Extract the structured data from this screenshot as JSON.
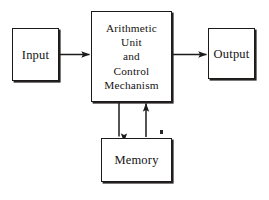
{
  "diagram": {
    "type": "block-diagram",
    "background_color": "#ffffff",
    "line_color": "#1c1b19",
    "text_color": "#141312",
    "nodes": [
      {
        "id": "input",
        "label": "Input",
        "shape": "rectangle",
        "x": 12,
        "y": 28,
        "width": 47,
        "height": 53
      },
      {
        "id": "cpu",
        "label": "Arithmetic\nUnit\nand\nControl\nMechanism",
        "shape": "rectangle",
        "x": 91,
        "y": 11,
        "width": 81,
        "height": 91
      },
      {
        "id": "output",
        "label": "Output",
        "shape": "rectangle",
        "x": 208,
        "y": 28,
        "width": 47,
        "height": 51
      },
      {
        "id": "memory",
        "label": "Memory",
        "shape": "rectangle",
        "x": 101,
        "y": 138,
        "width": 71,
        "height": 44
      }
    ],
    "edges": [
      {
        "id": "input-to-cpu",
        "from": "input",
        "to": "cpu",
        "direction": "right",
        "arrowhead": "end"
      },
      {
        "id": "cpu-to-output",
        "from": "cpu",
        "to": "output",
        "direction": "right",
        "arrowhead": "end"
      },
      {
        "id": "cpu-to-memory",
        "from": "cpu",
        "to": "memory",
        "direction": "down",
        "arrowhead": "end"
      },
      {
        "id": "memory-to-cpu",
        "from": "memory",
        "to": "cpu",
        "direction": "up",
        "arrowhead": "end"
      }
    ]
  }
}
